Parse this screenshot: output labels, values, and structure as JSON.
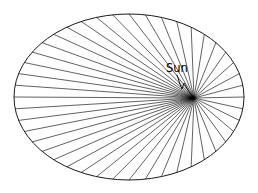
{
  "figure": {
    "background_color": "#ffffff",
    "stroke_color": "#000000",
    "width": 258,
    "height": 193
  },
  "labels": {
    "sun": "Sun"
  },
  "chart_data": {
    "type": "diagram",
    "annotations": [
      "Sun"
    ],
    "ellipse": {
      "center_x": 129,
      "center_y": 97,
      "radius_x": 115,
      "radius_y": 83,
      "stroke": "#1a1a1a",
      "fill": "none"
    },
    "focus": {
      "label": "Sun",
      "x": 194,
      "y": 98
    },
    "rays": {
      "count": 44,
      "description": "Radial line segments drawn from the focus to the ellipse boundary at equal-area (equal-time) intervals; short and fanned at perihelion on the right, long and densely packed toward aphelion on the left.",
      "stroke": "#000000",
      "stroke_width": 0.62
    },
    "leader": {
      "description": "Zigzag leader line from the Sun text label down to the focus point",
      "points": [
        [
          177,
          75
        ],
        [
          180,
          84
        ],
        [
          182,
          89
        ],
        [
          184,
          83
        ],
        [
          188,
          90
        ],
        [
          193,
          97
        ]
      ]
    },
    "label_position": {
      "sun_text_x": 166,
      "sun_text_y": 72
    }
  }
}
